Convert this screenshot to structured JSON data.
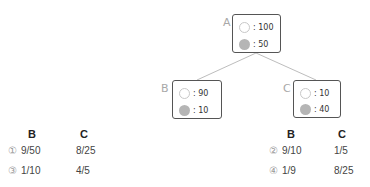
{
  "tree": {
    "nodes": {
      "A": {
        "label": "A",
        "white": ": 100",
        "gray": ": 50"
      },
      "B": {
        "label": "B",
        "white": ": 90",
        "gray": ": 10"
      },
      "C": {
        "label": "C",
        "white": ": 10",
        "gray": ": 40"
      }
    }
  },
  "options": {
    "headers": {
      "b": "B",
      "c": "C"
    },
    "left": [
      {
        "num": "①",
        "b": "9/50",
        "c": "8/25"
      },
      {
        "num": "③",
        "b": "1/10",
        "c": "4/5"
      }
    ],
    "right": [
      {
        "num": "②",
        "b": "9/10",
        "c": "1/5"
      },
      {
        "num": "④",
        "b": "1/9",
        "c": "8/25"
      }
    ]
  }
}
